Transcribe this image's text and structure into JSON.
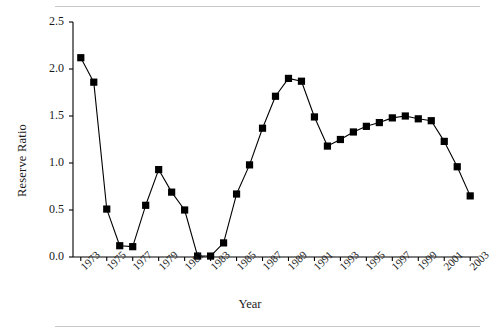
{
  "chart_data": {
    "type": "line",
    "title": "",
    "xlabel": "Year",
    "ylabel": "Reserve Ratio",
    "grid": false,
    "legend": false,
    "marker": "filled-square",
    "line_color": "#000000",
    "marker_color": "#000000",
    "xlim": [
      1972.4,
      2003.6
    ],
    "ylim": [
      0.0,
      2.5
    ],
    "ytick_labels": [
      "0.0",
      "0.5",
      "1.0",
      "1.5",
      "2.0",
      "2.5"
    ],
    "ytick_values": [
      0.0,
      0.5,
      1.0,
      1.5,
      2.0,
      2.5
    ],
    "xtick_labels": [
      "1973",
      "1975",
      "1977",
      "1979",
      "1981",
      "1983",
      "1985",
      "1987",
      "1989",
      "1991",
      "1993",
      "1995",
      "1997",
      "1999",
      "2001",
      "2003"
    ],
    "xtick_values": [
      1973,
      1975,
      1977,
      1979,
      1981,
      1983,
      1985,
      1987,
      1989,
      1991,
      1993,
      1995,
      1997,
      1999,
      2001,
      2003
    ],
    "x": [
      1973,
      1974,
      1975,
      1976,
      1977,
      1978,
      1979,
      1980,
      1981,
      1982,
      1983,
      1984,
      1985,
      1986,
      1987,
      1988,
      1989,
      1990,
      1991,
      1992,
      1993,
      1994,
      1995,
      1996,
      1997,
      1998,
      1999,
      2000,
      2001,
      2002,
      2003
    ],
    "values": [
      2.12,
      1.86,
      0.51,
      0.12,
      0.11,
      0.55,
      0.93,
      0.69,
      0.5,
      0.01,
      0.01,
      0.15,
      0.67,
      0.98,
      1.37,
      1.71,
      1.9,
      1.87,
      1.49,
      1.18,
      1.25,
      1.33,
      1.39,
      1.43,
      1.48,
      1.5,
      1.47,
      1.45,
      1.23,
      0.96,
      0.65
    ],
    "series": [
      {
        "name": "Reserve Ratio",
        "values": [
          2.12,
          1.86,
          0.51,
          0.12,
          0.11,
          0.55,
          0.93,
          0.69,
          0.5,
          0.01,
          0.01,
          0.15,
          0.67,
          0.98,
          1.37,
          1.71,
          1.9,
          1.87,
          1.49,
          1.18,
          1.25,
          1.33,
          1.39,
          1.43,
          1.48,
          1.5,
          1.47,
          1.45,
          1.23,
          0.96,
          0.65
        ]
      }
    ]
  }
}
